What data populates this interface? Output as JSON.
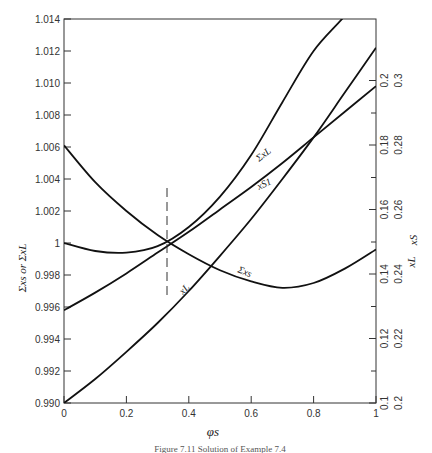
{
  "chart_data": {
    "type": "line",
    "title": "",
    "caption": "Figure 7.11 Solution of Example 7.4",
    "xlabel": "φs",
    "ylabel": "Σxs or ΣxL",
    "right_ylabels": [
      "xS",
      "xL"
    ],
    "xlim": [
      0,
      1
    ],
    "ylim": [
      0.99,
      1.014
    ],
    "x_ticks": [
      "0",
      "0.2",
      "0.4",
      "0.6",
      "0.8",
      "1"
    ],
    "y_ticks": [
      "0.990",
      "0.992",
      "0.994",
      "0.996",
      "0.998",
      "1",
      "1.002",
      "1.004",
      "1.006",
      "1.008",
      "1.010",
      "1.012",
      "1.014"
    ],
    "right_axis_xS_ticks": [
      "0.1",
      "0.12",
      "0.14",
      "0.16",
      "0.18",
      "0.2"
    ],
    "right_axis_xL_ticks": [
      "0.2",
      "0.22",
      "0.24",
      "0.26",
      "0.28",
      "0.3"
    ],
    "grid": false,
    "x": [
      0,
      0.1,
      0.2,
      0.3,
      0.4,
      0.5,
      0.6,
      0.7,
      0.8,
      0.9,
      1.0
    ],
    "series": [
      {
        "name": "ΣxL",
        "values": [
          1.0,
          0.9995,
          0.9994,
          0.9998,
          1.001,
          1.0029,
          1.0055,
          1.0088,
          1.012,
          1.0142,
          null
        ]
      },
      {
        "name": "Σxs",
        "values": [
          1.0061,
          1.0038,
          1.002,
          1.0005,
          0.9993,
          0.9983,
          0.9976,
          0.9972,
          0.9975,
          0.9984,
          0.9996
        ]
      },
      {
        "name": "xS1",
        "values": [
          0.9958,
          0.9969,
          0.9981,
          0.9994,
          1.0007,
          1.0021,
          1.0035,
          1.005,
          1.0066,
          1.0082,
          1.0098
        ]
      },
      {
        "name": "xL",
        "values": [
          0.99,
          0.9915,
          0.9932,
          0.995,
          0.997,
          0.9992,
          1.0015,
          1.004,
          1.0066,
          1.0094,
          1.0122
        ]
      }
    ],
    "annotations": [
      {
        "type": "dashed-vline",
        "x": 0.33,
        "label": "solution at φs ≈ 0.33"
      }
    ],
    "curve_labels": [
      "ΣxL",
      "xS1",
      "Σxs",
      "xL"
    ]
  },
  "labels": {
    "xlabel": "φs",
    "ylabel_left": "Σxs  or ΣxL",
    "ylabel_right_xs": "xS",
    "ylabel_right_xl": "xL",
    "caption": "Figure 7.11 Solution of Example 7.4",
    "curve_sum_xl": "ΣxL",
    "curve_xs1": "xS1",
    "curve_sum_xs": "Σxs",
    "curve_xl": "xL"
  }
}
